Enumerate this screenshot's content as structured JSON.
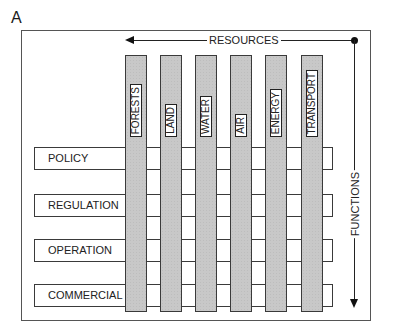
{
  "panel": {
    "letter": "A"
  },
  "axes": {
    "horizontal_label": "RESOURCES",
    "vertical_label": "FUNCTIONS"
  },
  "resources": [
    {
      "label": "FORESTS"
    },
    {
      "label": "LAND"
    },
    {
      "label": "WATER"
    },
    {
      "label": "AIR"
    },
    {
      "label": "ENERGY"
    },
    {
      "label": "TRANSPORT"
    }
  ],
  "functions": [
    {
      "label": "POLICY"
    },
    {
      "label": "REGULATION"
    },
    {
      "label": "OPERATION"
    },
    {
      "label": "COMMERCIAL"
    }
  ],
  "colors": {
    "column_fill": "#c8c8c8",
    "line": "#222222",
    "background": "#ffffff"
  }
}
